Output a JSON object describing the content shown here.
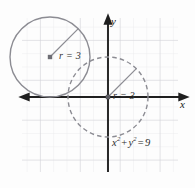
{
  "figure": {
    "background_color": "#fdfdfd",
    "grid_color": "#d8d8dc",
    "grid_minor_color": "#ebebef",
    "axis_color": "#1f1f1f",
    "curve_color": "#8a8a90",
    "label_color": "#2a2a2a"
  },
  "axes": {
    "x_label": "x",
    "y_label": "y",
    "origin": {
      "x": 108,
      "y": 97
    },
    "x_axis": {
      "start_x": 22,
      "end_x": 186,
      "y": 97
    },
    "y_axis": {
      "x": 108,
      "start_y": 172,
      "end_y": 17
    },
    "grid": {
      "cell_px": 13.3,
      "left": 22,
      "right": 178,
      "top": 18,
      "bottom": 172,
      "visible": true
    }
  },
  "shapes": {
    "solid_circle": {
      "name": "upper-left-circle",
      "style": "solid",
      "center_px": {
        "x": 50,
        "y": 57
      },
      "radius_px": 40,
      "radius_units": 3,
      "label": "r = 3",
      "label_r": "r",
      "label_eq": "=",
      "label_value": "3",
      "center_dot": true,
      "radius_line_to_px": {
        "x": 78,
        "y": 29
      }
    },
    "dashed_circle": {
      "name": "origin-circle",
      "style": "dashed",
      "center_px": {
        "x": 108,
        "y": 97
      },
      "radius_px": 40,
      "radius_units": 3,
      "label": "r = 3",
      "label_r": "r",
      "label_eq": "=",
      "label_value": "3",
      "center_dot": true,
      "radius_line_to_px": {
        "x": 136,
        "y": 69
      },
      "equation": "x² + y² = 9"
    }
  },
  "labels": {
    "equation": {
      "x_var": "x",
      "x_exp": "2",
      "plus": "+",
      "y_var": "y",
      "y_exp": "2",
      "equals": "=",
      "value": "9",
      "full": "x² + y² = 9"
    },
    "radius_upper": "r = 3",
    "radius_origin": "r = 3"
  }
}
